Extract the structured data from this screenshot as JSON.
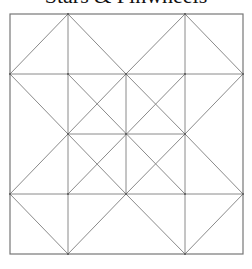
{
  "title": "Stars & Pinwheels",
  "colors": {
    "line": "#8a8a8a",
    "border": "#777777",
    "vertex": "#555555",
    "background": "#ffffff"
  },
  "diagram": {
    "type": "quilt-block-pattern",
    "grid": "4x4",
    "outer_square": {
      "x": 10,
      "y": 14,
      "width": 233,
      "height": 240
    },
    "grid_x": [
      10,
      68,
      126,
      185,
      243
    ],
    "grid_y": [
      14,
      74,
      134,
      194,
      254
    ],
    "lines": [
      [
        10,
        74,
        243,
        74
      ],
      [
        10,
        194,
        243,
        194
      ],
      [
        68,
        134,
        185,
        134
      ],
      [
        68,
        14,
        68,
        254
      ],
      [
        185,
        14,
        185,
        254
      ],
      [
        126,
        74,
        126,
        194
      ],
      [
        10,
        74,
        68,
        14
      ],
      [
        68,
        14,
        126,
        74
      ],
      [
        126,
        74,
        185,
        14
      ],
      [
        185,
        14,
        243,
        74
      ],
      [
        10,
        194,
        68,
        254
      ],
      [
        68,
        254,
        126,
        194
      ],
      [
        126,
        194,
        185,
        254
      ],
      [
        185,
        254,
        243,
        194
      ],
      [
        10,
        74,
        68,
        134
      ],
      [
        68,
        134,
        10,
        194
      ],
      [
        243,
        74,
        185,
        134
      ],
      [
        185,
        134,
        243,
        194
      ],
      [
        68,
        74,
        185,
        194
      ],
      [
        185,
        74,
        68,
        194
      ],
      [
        126,
        74,
        68,
        134
      ],
      [
        68,
        134,
        126,
        194
      ],
      [
        126,
        194,
        185,
        134
      ],
      [
        185,
        134,
        126,
        74
      ]
    ],
    "vertices": [
      [
        68,
        14
      ],
      [
        185,
        14
      ],
      [
        10,
        74
      ],
      [
        68,
        74
      ],
      [
        126,
        74
      ],
      [
        185,
        74
      ],
      [
        243,
        74
      ],
      [
        68,
        134
      ],
      [
        126,
        134
      ],
      [
        185,
        134
      ],
      [
        10,
        194
      ],
      [
        68,
        194
      ],
      [
        126,
        194
      ],
      [
        185,
        194
      ],
      [
        243,
        194
      ],
      [
        68,
        254
      ],
      [
        185,
        254
      ]
    ]
  }
}
